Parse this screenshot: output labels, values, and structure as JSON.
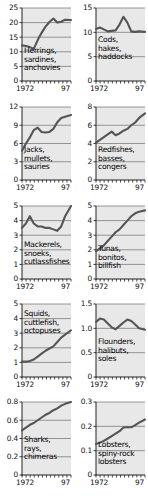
{
  "figure": {
    "type": "small-multiples-line-grid",
    "panel_count": 10,
    "columns": 2,
    "rows": 5,
    "shared_xlabels": [
      "1972",
      "97"
    ],
    "x_range": [
      1972,
      1997
    ],
    "plot_background": "#e8e8e8",
    "line_color": "#555555",
    "grid_color": "#6f6f6f",
    "text_color": "#111111"
  },
  "chart_data": [
    {
      "type": "line",
      "title": "Herrings, sardines, anchovies",
      "title_lines": [
        "Herrings,",
        "sardines,",
        "anchovies"
      ],
      "xlabel": "",
      "ylabel": "",
      "xlim": [
        1972,
        1997
      ],
      "ylim": [
        0,
        25
      ],
      "yticks": [
        0,
        5,
        10,
        15,
        20,
        25
      ],
      "ytick_labels": [
        "0",
        "5",
        "10",
        "15",
        "20",
        "25"
      ],
      "xticks": [
        1972,
        1997
      ],
      "xtick_labels": [
        "1972",
        "97"
      ],
      "grid": true,
      "x": [
        1972,
        1974,
        1976,
        1978,
        1980,
        1982,
        1984,
        1986,
        1988,
        1990,
        1992,
        1994,
        1997
      ],
      "values": [
        12.2,
        12.0,
        11.6,
        11.0,
        14.0,
        16.5,
        18.6,
        20.2,
        21.4,
        20.0,
        20.3,
        21.0,
        20.9
      ]
    },
    {
      "type": "line",
      "title": "Cods, hakes, haddocks",
      "title_lines": [
        "Cods,",
        "hakes,",
        "haddocks"
      ],
      "xlabel": "",
      "ylabel": "",
      "xlim": [
        1972,
        1997
      ],
      "ylim": [
        0,
        15
      ],
      "yticks": [
        0,
        5,
        10,
        15
      ],
      "ytick_labels": [
        "0",
        "5",
        "10",
        "15"
      ],
      "xticks": [
        1972,
        1997
      ],
      "xtick_labels": [
        "1972",
        "97"
      ],
      "grid": true,
      "x": [
        1972,
        1974,
        1976,
        1978,
        1980,
        1982,
        1984,
        1986,
        1988,
        1990,
        1992,
        1994,
        1997
      ],
      "values": [
        10.7,
        11.0,
        10.6,
        10.2,
        10.3,
        10.4,
        11.6,
        13.2,
        12.0,
        10.2,
        10.1,
        10.2,
        10.1
      ]
    },
    {
      "type": "line",
      "title": "Jacks, mullets, sauries",
      "title_lines": [
        "Jacks,",
        "mullets,",
        "sauries"
      ],
      "xlabel": "",
      "ylabel": "",
      "xlim": [
        1972,
        1997
      ],
      "ylim": [
        0,
        12
      ],
      "yticks": [
        0,
        3,
        6,
        9,
        12
      ],
      "ytick_labels": [
        "0",
        "3",
        "6",
        "9",
        "12"
      ],
      "xticks": [
        1972,
        1997
      ],
      "xtick_labels": [
        "1972",
        "97"
      ],
      "grid": true,
      "x": [
        1972,
        1974,
        1976,
        1978,
        1980,
        1982,
        1984,
        1986,
        1988,
        1990,
        1992,
        1994,
        1997
      ],
      "values": [
        4.8,
        6.0,
        7.0,
        8.2,
        8.6,
        7.9,
        7.8,
        7.9,
        8.4,
        9.5,
        10.2,
        10.4,
        10.7
      ]
    },
    {
      "type": "line",
      "title": "Redfishes, basses, congers",
      "title_lines": [
        "Redfishes,",
        "basses,",
        "congers"
      ],
      "xlabel": "",
      "ylabel": "",
      "xlim": [
        1972,
        1997
      ],
      "ylim": [
        0,
        8
      ],
      "yticks": [
        0,
        2,
        4,
        6,
        8
      ],
      "ytick_labels": [
        "0",
        "2",
        "4",
        "6",
        "8"
      ],
      "xticks": [
        1972,
        1997
      ],
      "xtick_labels": [
        "1972",
        "97"
      ],
      "grid": true,
      "x": [
        1972,
        1974,
        1976,
        1978,
        1980,
        1982,
        1984,
        1986,
        1988,
        1990,
        1992,
        1994,
        1997
      ],
      "values": [
        4.1,
        4.4,
        4.7,
        5.0,
        5.3,
        4.9,
        5.1,
        5.4,
        5.6,
        6.0,
        6.3,
        6.8,
        7.3
      ]
    },
    {
      "type": "line",
      "title": "Mackerels, snoeks, cutlassfishes",
      "title_lines": [
        "Mackerels,",
        "snoeks,",
        "cutlassfishes"
      ],
      "xlabel": "",
      "ylabel": "",
      "xlim": [
        1972,
        1997
      ],
      "ylim": [
        0,
        5
      ],
      "yticks": [
        0,
        1,
        2,
        3,
        4,
        5
      ],
      "ytick_labels": [
        "0",
        "1",
        "2",
        "3",
        "4",
        "5"
      ],
      "xticks": [
        1972,
        1997
      ],
      "xtick_labels": [
        "1972",
        "97"
      ],
      "grid": true,
      "x": [
        1972,
        1974,
        1976,
        1978,
        1980,
        1982,
        1984,
        1986,
        1988,
        1990,
        1992,
        1994,
        1997
      ],
      "values": [
        3.5,
        3.8,
        4.3,
        3.8,
        3.6,
        3.6,
        3.5,
        3.5,
        3.4,
        3.3,
        3.6,
        4.3,
        5.0
      ]
    },
    {
      "type": "line",
      "title": "Tunas, bonitos, billfish",
      "title_lines": [
        "Tunas,",
        "bonitos,",
        "billfish"
      ],
      "xlabel": "",
      "ylabel": "",
      "xlim": [
        1972,
        1997
      ],
      "ylim": [
        0,
        5
      ],
      "yticks": [
        0,
        1,
        2,
        3,
        4,
        5
      ],
      "ytick_labels": [
        "0",
        "1",
        "2",
        "3",
        "4",
        "5"
      ],
      "xticks": [
        1972,
        1997
      ],
      "xtick_labels": [
        "1972",
        "97"
      ],
      "grid": true,
      "x": [
        1972,
        1974,
        1976,
        1978,
        1980,
        1982,
        1984,
        1986,
        1988,
        1990,
        1992,
        1994,
        1997
      ],
      "values": [
        1.9,
        2.1,
        2.3,
        2.6,
        2.9,
        3.2,
        3.4,
        3.7,
        4.0,
        4.3,
        4.5,
        4.6,
        4.7
      ]
    },
    {
      "type": "line",
      "title": "Squids, cuttlefish, octopuses",
      "title_lines": [
        "Squids,",
        "cuttlefish,",
        "octopuses"
      ],
      "xlabel": "",
      "ylabel": "",
      "xlim": [
        1972,
        1997
      ],
      "ylim": [
        0,
        5
      ],
      "yticks": [
        0,
        1,
        2,
        3,
        4,
        5
      ],
      "ytick_labels": [
        "0",
        "1",
        "2",
        "3",
        "4",
        "5"
      ],
      "xticks": [
        1972,
        1997
      ],
      "xtick_labels": [
        "1972",
        "97"
      ],
      "grid": true,
      "x": [
        1972,
        1974,
        1976,
        1978,
        1980,
        1982,
        1984,
        1986,
        1988,
        1990,
        1992,
        1994,
        1997
      ],
      "values": [
        1.05,
        1.05,
        1.1,
        1.2,
        1.4,
        1.6,
        1.8,
        1.95,
        2.1,
        2.4,
        2.7,
        2.9,
        3.2
      ]
    },
    {
      "type": "line",
      "title": "Flounders, halibuts, soles",
      "title_lines": [
        "Flounders,",
        "halibuts,",
        "soles"
      ],
      "xlabel": "",
      "ylabel": "",
      "xlim": [
        1972,
        1997
      ],
      "ylim": [
        0,
        1.5
      ],
      "yticks": [
        0,
        0.5,
        1.0,
        1.5
      ],
      "ytick_labels": [
        "0",
        "0.5",
        "1.0",
        "1.5"
      ],
      "xticks": [
        1972,
        1997
      ],
      "xtick_labels": [
        "1972",
        "97"
      ],
      "grid": true,
      "x": [
        1972,
        1974,
        1976,
        1978,
        1980,
        1982,
        1984,
        1986,
        1988,
        1990,
        1992,
        1994,
        1997
      ],
      "values": [
        1.13,
        1.2,
        1.18,
        1.1,
        1.02,
        0.98,
        1.05,
        1.12,
        1.18,
        1.15,
        1.08,
        1.0,
        0.97
      ]
    },
    {
      "type": "line",
      "title": "Sharks, rays, chimeras",
      "title_lines": [
        "Sharks,",
        "rays,",
        "chimeras"
      ],
      "xlabel": "",
      "ylabel": "",
      "xlim": [
        1972,
        1997
      ],
      "ylim": [
        0,
        0.8
      ],
      "yticks": [
        0,
        0.2,
        0.4,
        0.6,
        0.8
      ],
      "ytick_labels": [
        "0",
        "0.2",
        "0.4",
        "0.6",
        "0.8"
      ],
      "xticks": [
        1972,
        1997
      ],
      "xtick_labels": [
        "1972",
        "97"
      ],
      "grid": true,
      "x": [
        1972,
        1974,
        1976,
        1978,
        1980,
        1982,
        1984,
        1986,
        1988,
        1990,
        1992,
        1994,
        1997
      ],
      "values": [
        0.49,
        0.52,
        0.55,
        0.57,
        0.6,
        0.63,
        0.66,
        0.68,
        0.71,
        0.73,
        0.76,
        0.78,
        0.8
      ]
    },
    {
      "type": "line",
      "title": "Lobsters, spiny-rock lobsters",
      "title_lines": [
        "Lobsters,",
        "spiny-rock",
        "lobsters"
      ],
      "xlabel": "",
      "ylabel": "",
      "xlim": [
        1972,
        1997
      ],
      "ylim": [
        0,
        0.3
      ],
      "yticks": [
        0,
        0.1,
        0.2,
        0.3
      ],
      "ytick_labels": [
        "0",
        "0.1",
        "0.2",
        "0.3"
      ],
      "xticks": [
        1972,
        1997
      ],
      "xtick_labels": [
        "1972",
        "97"
      ],
      "grid": true,
      "x": [
        1972,
        1974,
        1976,
        1978,
        1980,
        1982,
        1984,
        1986,
        1988,
        1990,
        1992,
        1994,
        1997
      ],
      "values": [
        0.127,
        0.133,
        0.14,
        0.15,
        0.16,
        0.17,
        0.18,
        0.195,
        0.196,
        0.196,
        0.205,
        0.215,
        0.228
      ]
    }
  ]
}
